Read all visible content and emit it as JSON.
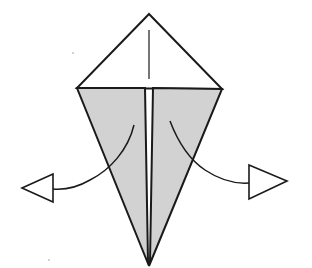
{
  "diagram": {
    "type": "origami-fold-step",
    "colors": {
      "background": "#ffffff",
      "line": "#1a1a1a",
      "flap_fill": "#d2d2d2",
      "arrowhead_fill": "#ffffff"
    },
    "shapes": {
      "top_triangle": {
        "points": "149,14 77,88 222,89"
      },
      "center_crease": {
        "x1": 149,
        "y1": 30,
        "x2": 149,
        "y2": 79
      },
      "left_flap": {
        "points": "77,88 145,88 148,262 149,266"
      },
      "right_flap": {
        "points": "153,88 222,89 149,266 150,262"
      },
      "left_arrow": {
        "path": "M134,125 C128,150 110,170 90,180 C78,187 65,190 53,189",
        "head": "22,188 53,174 53,202"
      },
      "right_arrow": {
        "path": "M170,121 C178,142 190,160 205,170 C220,180 235,184 249,183",
        "head": "249,165 287,181 249,199"
      }
    },
    "labels": []
  }
}
